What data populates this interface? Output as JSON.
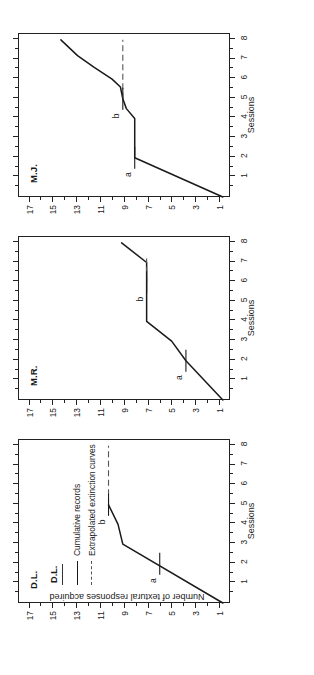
{
  "figure": {
    "axis_x_label": "Sessions",
    "axis_y_label": "Number of textural responses acquired"
  },
  "legend": {
    "subject": "D.L.",
    "items": [
      {
        "label": "Cumulative records",
        "style": "solid"
      },
      {
        "label": "Extrapolated extinction curves",
        "style": "dashed"
      }
    ]
  },
  "axes": {
    "y_major_labels": [
      "1",
      "3",
      "5",
      "7",
      "9",
      "11",
      "13",
      "15",
      "17"
    ],
    "y_major_values": [
      1,
      3,
      5,
      7,
      9,
      11,
      13,
      15,
      17
    ],
    "y_minor_values": [
      2,
      4,
      6,
      8,
      10,
      12,
      14,
      16
    ],
    "y_min": 0,
    "y_max": 17.8,
    "x_major_labels": [
      "1",
      "2",
      "3",
      "4",
      "5",
      "6",
      "7",
      "8"
    ],
    "x_major_values": [
      1,
      2,
      3,
      4,
      5,
      6,
      7,
      8
    ],
    "x_min": 0,
    "x_max": 8.35
  },
  "chart_data": {
    "type": "line",
    "xlabel": "Sessions",
    "ylabel": "Number of textural responses acquired",
    "xlim": [
      0,
      8.35
    ],
    "ylim": [
      0,
      17.8
    ],
    "grid": false,
    "legend_position": "inside-top-left-panel-1",
    "panels": [
      {
        "name": "D.L.",
        "series": [
          {
            "name": "Cumulative records",
            "style": "solid",
            "x": [
              0.0,
              3.0,
              4.0,
              5.0
            ],
            "y": [
              0.6,
              9.0,
              9.4,
              10.2
            ]
          },
          {
            "name": "Extrapolated extinction curves",
            "style": "dashed",
            "x": [
              5.0,
              8.0
            ],
            "y": [
              10.2,
              10.2
            ]
          }
        ],
        "annotations": [
          {
            "label": "a",
            "x": 2.0,
            "y": 5.9
          },
          {
            "label": "b",
            "x": 5.0,
            "y": 10.2
          }
        ]
      },
      {
        "name": "M.R.",
        "series": [
          {
            "name": "Cumulative records",
            "style": "solid",
            "x": [
              0.0,
              2.0,
              3.0,
              4.0,
              6.0,
              7.0,
              8.0
            ],
            "y": [
              0.6,
              3.7,
              4.9,
              7.0,
              7.0,
              7.0,
              9.1
            ]
          },
          {
            "name": "Extrapolated extinction curves",
            "style": "dashed",
            "x": [
              6.0,
              7.2
            ],
            "y": [
              7.0,
              7.0
            ]
          }
        ],
        "annotations": [
          {
            "label": "a",
            "x": 2.0,
            "y": 3.7
          },
          {
            "label": "b",
            "x": 6.0,
            "y": 7.0
          }
        ]
      },
      {
        "name": "M.J.",
        "series": [
          {
            "name": "Cumulative records",
            "style": "solid",
            "x": [
              0.0,
              2.0,
              2.0,
              4.0,
              4.5,
              5.0,
              5.6,
              6.0,
              6.6,
              7.2,
              8.0
            ],
            "y": [
              0.6,
              8.0,
              8.0,
              8.0,
              8.7,
              9.0,
              9.2,
              9.9,
              11.4,
              12.8,
              14.2
            ]
          },
          {
            "name": "Extrapolated extinction curves",
            "style": "dashed",
            "x": [
              5.0,
              8.0
            ],
            "y": [
              9.0,
              9.0
            ]
          }
        ],
        "annotations": [
          {
            "label": "a",
            "x": 2.0,
            "y": 8.0
          },
          {
            "label": "b",
            "x": 5.0,
            "y": 9.0
          }
        ]
      }
    ]
  }
}
